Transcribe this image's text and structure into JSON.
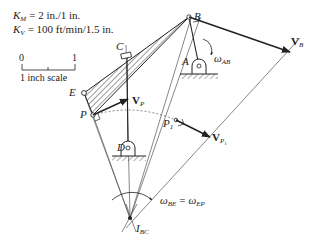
{
  "scales": {
    "km_label": "K",
    "km_sub": "M",
    "km_value": "= 2 in./1 in.",
    "kv_label": "K",
    "kv_sub": "V",
    "kv_value": "= 100 ft/min/1.5 in."
  },
  "scale_bar": {
    "left_tick": "0",
    "right_tick": "1",
    "caption": "1 inch scale"
  },
  "points": {
    "A": "A",
    "B": "B",
    "C": "C",
    "D": "D",
    "E": "E",
    "P": "P",
    "P1": "P",
    "P1_sub": "1",
    "I_label": "I",
    "I_sub": "BC"
  },
  "vectors": {
    "VB": "V",
    "VB_sub": "B",
    "VP": "V",
    "VP_sub": "P",
    "VP1": "V",
    "VP1_sub": "P",
    "VP1_subsub": "1"
  },
  "angular": {
    "omega_ab": "ω",
    "omega_ab_sub": "AB",
    "omega_be": "ω",
    "omega_be_sub": "BE",
    "equals": "=",
    "omega_ep": "ω",
    "omega_ep_sub": "EP"
  },
  "colors": {
    "line": "#222222",
    "thin": "#555555"
  }
}
